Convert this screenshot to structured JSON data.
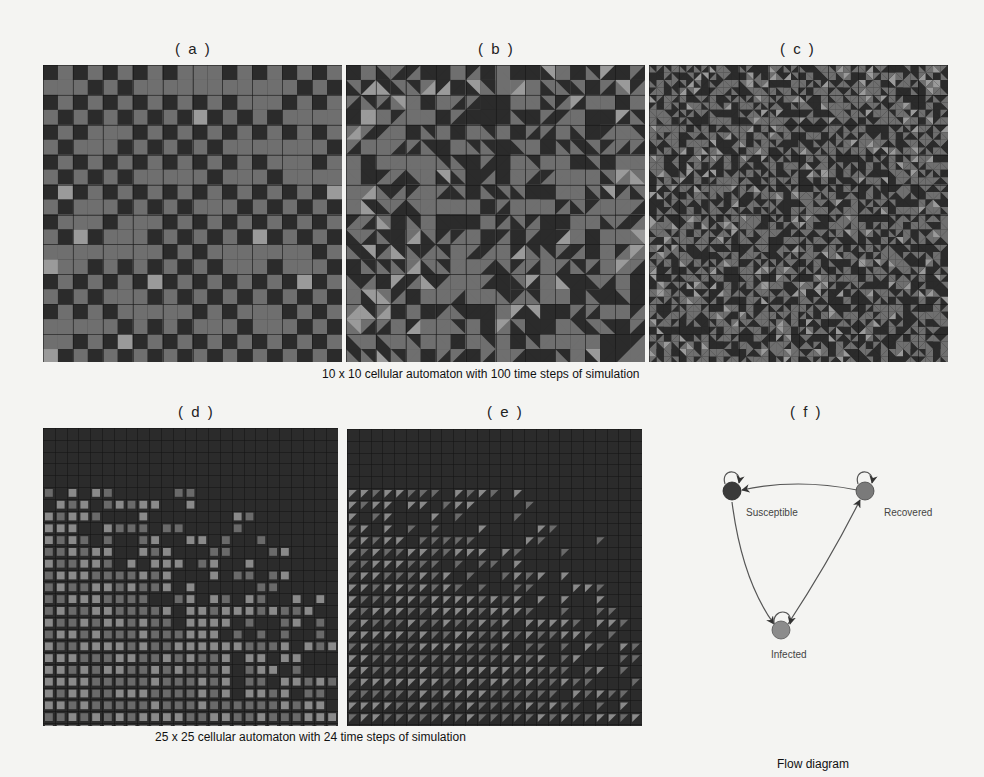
{
  "figure": {
    "top_row": {
      "caption": "10 x 10 cellular automaton with 100 time steps of simulation",
      "panels": [
        {
          "label": "( a )",
          "style": "squares",
          "grid_size": 10,
          "cells_per_block": 2
        },
        {
          "label": "( b )",
          "style": "triangles",
          "grid_size": 10,
          "cells_per_block": 2
        },
        {
          "label": "( c )",
          "style": "pinwheels",
          "grid_size": 10,
          "cells_per_block": 2
        }
      ]
    },
    "bottom_row": {
      "caption": "25 x 25 cellular automaton with 24 time steps of simulation",
      "panels": [
        {
          "label": "( d )",
          "style": "squares",
          "grid_size": 25
        },
        {
          "label": "( e )",
          "style": "triangles",
          "grid_size": 25
        }
      ]
    },
    "flow": {
      "label": "( f )",
      "caption": "Flow diagram",
      "nodes": [
        {
          "id": "S",
          "name": "Susceptible",
          "color": "#3a3a3a"
        },
        {
          "id": "R",
          "name": "Recovered",
          "color": "#7a7a7a"
        },
        {
          "id": "I",
          "name": "Infected",
          "color": "#8c8c8c"
        }
      ],
      "edges": [
        {
          "from": "R",
          "to": "S"
        },
        {
          "from": "S",
          "to": "I"
        },
        {
          "from": "I",
          "to": "R"
        },
        {
          "from": "S",
          "to": "S"
        },
        {
          "from": "R",
          "to": "R"
        },
        {
          "from": "I",
          "to": "I"
        }
      ]
    },
    "colors": {
      "dark": "#2b2b2b",
      "mid": "#6f6f6f",
      "light": "#9a9a9a",
      "background": "#f4f4f2"
    }
  }
}
